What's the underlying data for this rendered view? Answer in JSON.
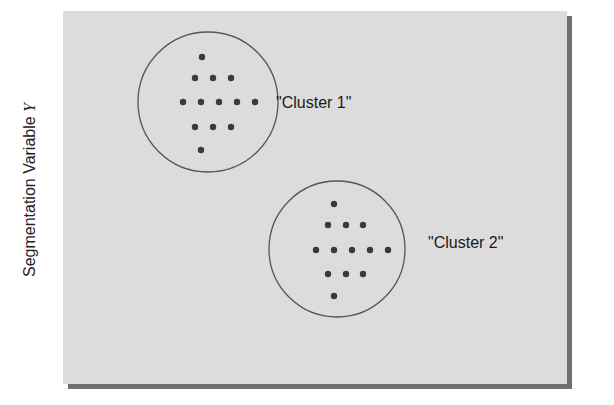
{
  "axis": {
    "y_label_prefix": "Segmentation Variable ",
    "y_label_var": "Y"
  },
  "colors": {
    "panel_fill": "#dcdcdc",
    "panel_shadow": "#6f6f6f",
    "circle_stroke": "#555555",
    "dot_fill": "#3a3a3a",
    "text": "#1a1a1a"
  },
  "clusters": [
    {
      "label": "\"Cluster 1\"",
      "circle": {
        "cx": 208,
        "cy": 102,
        "r": 70
      },
      "label_pos": {
        "x": 276,
        "y": 103
      },
      "points": [
        [
          202,
          57
        ],
        [
          195,
          78
        ],
        [
          213,
          78
        ],
        [
          231,
          78
        ],
        [
          183,
          102
        ],
        [
          201,
          102
        ],
        [
          219,
          102
        ],
        [
          237,
          102
        ],
        [
          255,
          102
        ],
        [
          195,
          127
        ],
        [
          213,
          127
        ],
        [
          231,
          127
        ],
        [
          201,
          150
        ]
      ]
    },
    {
      "label": "\"Cluster 2\"",
      "circle": {
        "cx": 337,
        "cy": 249,
        "r": 68
      },
      "label_pos": {
        "x": 428,
        "y": 243
      },
      "points": [
        [
          334,
          204
        ],
        [
          328,
          225
        ],
        [
          346,
          225
        ],
        [
          363,
          225
        ],
        [
          316,
          250
        ],
        [
          334,
          250
        ],
        [
          352,
          250
        ],
        [
          370,
          250
        ],
        [
          388,
          250
        ],
        [
          328,
          274
        ],
        [
          346,
          274
        ],
        [
          363,
          274
        ],
        [
          334,
          296
        ]
      ]
    }
  ]
}
